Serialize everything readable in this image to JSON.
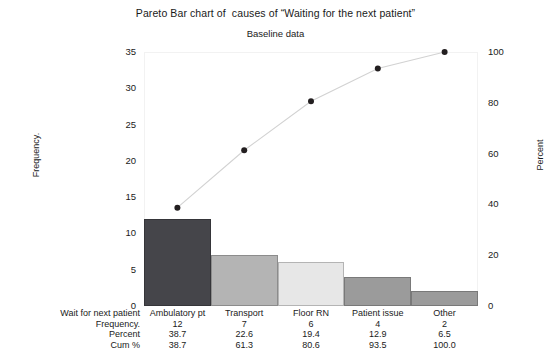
{
  "chart_data": {
    "type": "bar",
    "title": "Pareto Bar chart of  causes of “Waiting for the next patient”",
    "subtitle": "Baseline data",
    "categories": [
      "Ambulatory pt",
      "Transport",
      "Floor RN",
      "Patient issue",
      "Other"
    ],
    "values": [
      12,
      7,
      6,
      4,
      2
    ],
    "percent": [
      38.7,
      22.6,
      19.4,
      12.9,
      6.5
    ],
    "cum_percent": [
      38.7,
      61.3,
      80.6,
      93.5,
      100.0
    ],
    "xlabel": "",
    "ylabel": "Frequency.",
    "y2label": "Percent",
    "ylim": [
      0,
      35
    ],
    "y2lim": [
      0,
      100
    ],
    "yticks": [
      "0",
      "5",
      "10",
      "15",
      "20",
      "25",
      "30",
      "35"
    ],
    "y2ticks": [
      "0",
      "20",
      "40",
      "60",
      "80",
      "100"
    ],
    "grid": false,
    "legend": "none",
    "series": [
      {
        "name": "Frequency.",
        "type": "bar",
        "values": [
          12,
          7,
          6,
          4,
          2
        ]
      },
      {
        "name": "Cum %",
        "type": "line",
        "values": [
          38.7,
          61.3,
          80.6,
          93.5,
          100.0
        ]
      }
    ],
    "bar_colors": [
      "#45454a",
      "#b4b4b4",
      "#e7e7e7",
      "#9b9b9b",
      "#9b9b9b"
    ],
    "line_color": "#d2d2d2",
    "marker_color": "#231f20"
  },
  "table": {
    "row_labels": [
      "Wait for next patient",
      "Frequency.",
      "Percent",
      "Cum %"
    ],
    "rows": [
      [
        "Ambulatory pt",
        "Transport",
        "Floor RN",
        "Patient issue",
        "Other"
      ],
      [
        "12",
        "7",
        "6",
        "4",
        "2"
      ],
      [
        "38.7",
        "22.6",
        "19.4",
        "12.9",
        "6.5"
      ],
      [
        "38.7",
        "61.3",
        "80.6",
        "93.5",
        "100.0"
      ]
    ]
  }
}
